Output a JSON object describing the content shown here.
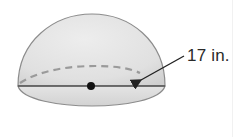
{
  "figure": {
    "shape": "hemisphere",
    "dimension_label": "17 in.",
    "dimension_refers_to": "radius",
    "colors": {
      "fill": "#e2e2e2",
      "outline": "#8c8c8c",
      "dashed": "#9a9a9a",
      "base_line": "#555555",
      "center_dot": "#111111",
      "arrow": "#222222",
      "text": "#2a2a2a"
    }
  }
}
